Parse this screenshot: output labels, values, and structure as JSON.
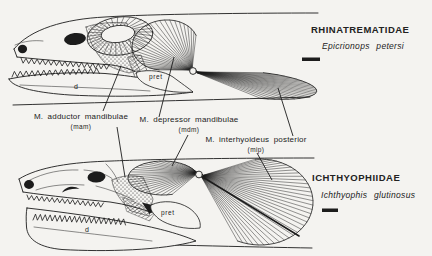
{
  "figure": {
    "colors": {
      "ink": "#1c1c1c",
      "paper": "#f4f3f0",
      "text": "#222222"
    },
    "top_panel": {
      "family": "RHINATREMATIDAE",
      "species": "Epicrionops petersi",
      "bones": {
        "pret": "pret",
        "d": "d"
      }
    },
    "bottom_panel": {
      "family": "ICHTHYOPHIIDAE",
      "species": "Ichthyophis glutinosus",
      "bones": {
        "pret": "pret",
        "d": "d"
      }
    },
    "muscle_labels": [
      {
        "name": "M. adductor mandibulae",
        "abbr": "(mam)"
      },
      {
        "name": "M. depressor mandibulae",
        "abbr": "(mdm)"
      },
      {
        "name": "M. interhyoideus posterior",
        "abbr": "(mip)"
      }
    ]
  }
}
